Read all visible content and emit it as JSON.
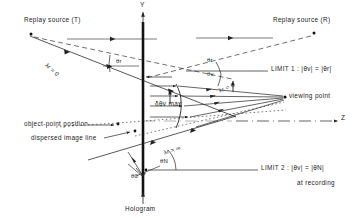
{
  "figure": {
    "title_present": false,
    "type": "optical-ray-diagram",
    "background": "#ffffff",
    "stroke": "#222222",
    "size": {
      "width": 363,
      "height": 219
    }
  },
  "axes": {
    "y_label": "Y",
    "z_label": "Z",
    "y_axis_name": "vertical-axis",
    "z_axis_name": "horizontal-optical-axis"
  },
  "labels": {
    "replay_source_t": "Replay source (T)",
    "replay_source_r": "Replay source (R)",
    "viewing_point": "viewing point",
    "hologram": "Hologram",
    "object_point_position": "object-point position",
    "dispersed_image_line": "dispersed image line",
    "delta_theta_v_max": "δθv max",
    "limit1": "LIMIT 1 :  |θv| = |θr|",
    "limit2": "LIMIT 2 :  |θv| = |θN|",
    "at_recording": "at recording"
  },
  "angles": [
    {
      "name": "theta-r",
      "text": "θr"
    },
    {
      "name": "theta-v",
      "text": "θv"
    },
    {
      "name": "theta-N-upper",
      "text": "θN"
    },
    {
      "name": "theta-N-lower",
      "text": "θN"
    },
    {
      "name": "theta-0",
      "text": "θ0"
    }
  ],
  "wavelength_markers": [
    {
      "name": "lambda-r-zero-left",
      "text": "λr = 0"
    },
    {
      "name": "lambda-r-zero-right",
      "text": "λr = 0"
    },
    {
      "name": "lambda-r-infinity",
      "text": "λr = ∞"
    }
  ],
  "colors": {
    "ink": "#222222",
    "paper": "#ffffff",
    "hologram_bar": "#111111"
  }
}
